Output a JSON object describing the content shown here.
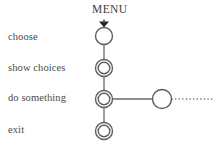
{
  "diagram": {
    "title": "MENU",
    "type": "state-transition-diagram",
    "canvas": {
      "width": 214,
      "height": 149,
      "background": "#ffffff"
    },
    "colors": {
      "stroke": "#6b6b6b",
      "node_stroke": "#5d5d5d",
      "arrow_fill": "#262626",
      "text": "#4a4a4a",
      "title_text": "#3d3d3d",
      "background": "#ffffff"
    },
    "labels": [
      {
        "id": "choose",
        "text": "choose",
        "x": 8,
        "y": 42
      },
      {
        "id": "show-choices",
        "text": "show choices",
        "x": 8,
        "y": 73
      },
      {
        "id": "do-something",
        "text": "do something",
        "x": 8,
        "y": 103
      },
      {
        "id": "exit",
        "text": "exit",
        "x": 8,
        "y": 135
      }
    ],
    "title_position": {
      "x": 92,
      "y": 15
    },
    "nodes": [
      {
        "id": "node-choose",
        "label": "choose",
        "cx": 104,
        "cy": 36,
        "r_outer": 8.5,
        "r_inner": null,
        "style": "single",
        "has_entry_arrow": true
      },
      {
        "id": "node-show-choices",
        "label": "show choices",
        "cx": 104,
        "cy": 68,
        "r_outer": 8.5,
        "r_inner": 5.8,
        "style": "double",
        "has_entry_arrow": false
      },
      {
        "id": "node-do-something",
        "label": "do something",
        "cx": 104,
        "cy": 99,
        "r_outer": 8.5,
        "r_inner": 5.8,
        "style": "double",
        "has_entry_arrow": false
      },
      {
        "id": "node-exit",
        "label": "exit",
        "cx": 104,
        "cy": 131,
        "r_outer": 8.5,
        "r_inner": 5.8,
        "style": "double",
        "has_entry_arrow": false
      },
      {
        "id": "node-branch",
        "label": "",
        "cx": 162,
        "cy": 99,
        "r_outer": 9.5,
        "r_inner": null,
        "style": "single",
        "has_entry_arrow": false
      }
    ],
    "edges": [
      {
        "id": "edge-choose-to-show",
        "from": "node-choose",
        "to": "node-show-choices",
        "x1": 104,
        "y1": 44.5,
        "x2": 104,
        "y2": 59.5,
        "dashed": false
      },
      {
        "id": "edge-show-to-do",
        "from": "node-show-choices",
        "to": "node-do-something",
        "x1": 104,
        "y1": 76.5,
        "x2": 104,
        "y2": 90.5,
        "dashed": false
      },
      {
        "id": "edge-do-to-exit",
        "from": "node-do-something",
        "to": "node-exit",
        "x1": 104,
        "y1": 107.5,
        "x2": 104,
        "y2": 122.5,
        "dashed": false
      },
      {
        "id": "edge-do-to-branch",
        "from": "node-do-something",
        "to": "node-branch",
        "x1": 112.5,
        "y1": 99,
        "x2": 152.5,
        "y2": 99,
        "dashed": false
      },
      {
        "id": "edge-branch-continues",
        "from": "node-branch",
        "to": null,
        "x1": 171.5,
        "y1": 99,
        "x2": 214,
        "y2": 99,
        "dashed": true
      }
    ],
    "entry_arrow": {
      "id": "entry-arrow",
      "shape": "filled-down-triangle",
      "cx": 104,
      "tip_y": 27.5,
      "base_y": 21.5,
      "half_width": 5.0,
      "stem": {
        "x": 104,
        "y1": 19.5,
        "y2": 21.5
      }
    },
    "continuation": {
      "style": "dotted",
      "description": "line continues off-canvas to the right"
    }
  }
}
